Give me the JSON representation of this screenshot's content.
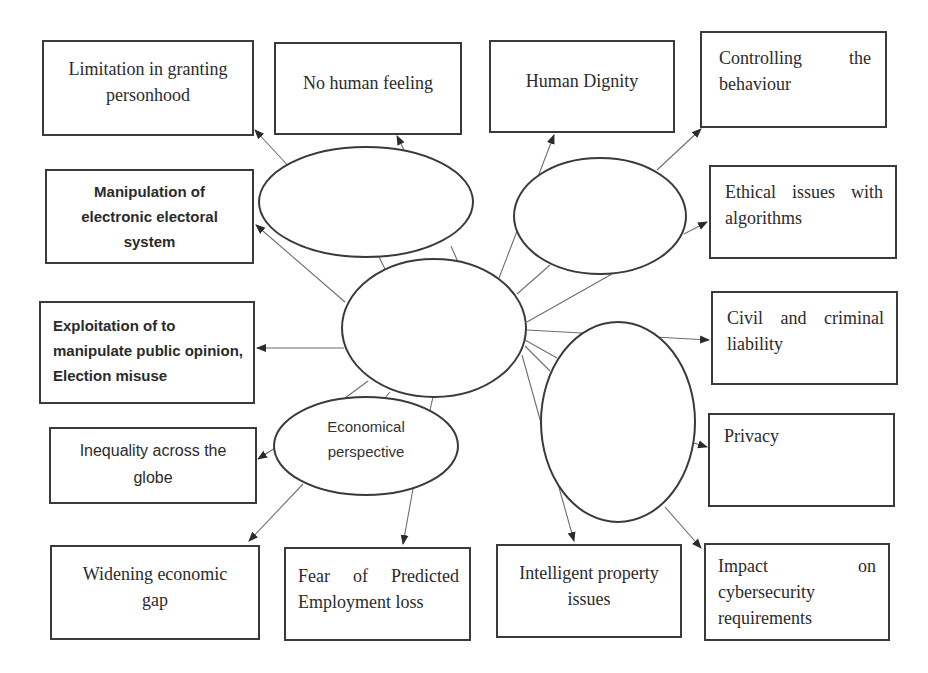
{
  "diagram": {
    "colors": {
      "stroke": "#3a3a3a",
      "connector": "#6e6e6e",
      "text": "#2b2b2b",
      "background": "#ffffff"
    },
    "nodes": {
      "ellipse_top_left": {
        "label": ""
      },
      "ellipse_top_right": {
        "label": ""
      },
      "ellipse_center": {
        "label": ""
      },
      "ellipse_economic": {
        "label_line1": "Economical",
        "label_line2": "perspective"
      },
      "ellipse_right": {
        "label": ""
      }
    },
    "boxes": {
      "limitation_personhood": "Limitation in granting personhood",
      "no_human_feeling": "No human feeling",
      "human_dignity": "Human Dignity",
      "controlling_behaviour": "Controlling the behaviour",
      "manipulation_electoral": "Manipulation of electronic electoral system",
      "ethical_algorithms": "Ethical issues with algorithms",
      "exploitation_public_opinion": "Exploitation of to manipulate public opinion, Election misuse",
      "civil_criminal_liability": "Civil and criminal liability",
      "inequality_globe": "Inequality across the globe",
      "privacy": "Privacy",
      "widening_gap": "Widening economic gap",
      "employment_loss": "Fear of Predicted Employment loss",
      "intelligent_property": "Intelligent property issues",
      "cybersecurity_impact": "Impact on cybersecurity requirements"
    }
  }
}
